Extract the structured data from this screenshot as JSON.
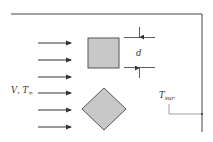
{
  "diagram": {
    "type": "cross-flow heat transfer schematic",
    "flow_label": {
      "symbol": "V",
      "separator": ", ",
      "temp_symbol": "T",
      "temp_subscript": "∞"
    },
    "dimension_label": "d",
    "surroundings_label": {
      "symbol": "T",
      "subscript": "sur"
    },
    "flow_arrow_count": 6,
    "shapes": [
      {
        "name": "square",
        "orientation": "aligned"
      },
      {
        "name": "diamond",
        "orientation": "rotated-45"
      }
    ],
    "colors": {
      "background": "#ffffff",
      "shape_fill": "#c8c8c8",
      "shape_stroke": "#555555",
      "line": "#333333",
      "enclosure": "#444444",
      "leader": "#888888",
      "text": "#333333"
    }
  }
}
